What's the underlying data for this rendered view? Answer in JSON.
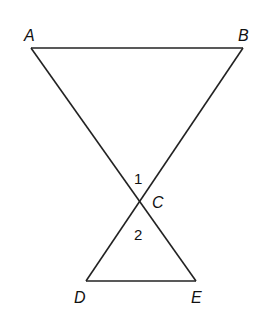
{
  "diagram": {
    "type": "intersecting-triangles",
    "points": {
      "A": {
        "label": "A",
        "x": 31,
        "y": 48
      },
      "B": {
        "label": "B",
        "x": 243,
        "y": 48
      },
      "C": {
        "label": "C",
        "x": 140,
        "y": 202
      },
      "D": {
        "label": "D",
        "x": 86,
        "y": 281
      },
      "E": {
        "label": "E",
        "x": 196,
        "y": 281
      }
    },
    "angles": {
      "angle1": {
        "label": "1"
      },
      "angle2": {
        "label": "2"
      }
    },
    "segments": [
      "AB",
      "AE",
      "BD",
      "DE"
    ],
    "stroke_color": "#222222"
  }
}
